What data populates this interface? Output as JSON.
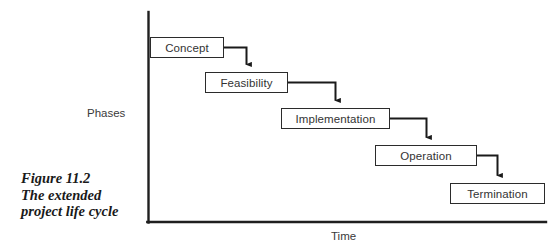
{
  "figure": {
    "caption_lines": [
      "Figure 11.2",
      "The extended",
      "project life cycle"
    ],
    "caption_full": "Figure 11.2 The extended project life cycle"
  },
  "axes": {
    "y_label": "Phases",
    "x_label": "Time",
    "origin": {
      "x": 148,
      "y": 222
    },
    "y_top": 12,
    "x_right": 546,
    "line_color": "#1f1f1f"
  },
  "diagram": {
    "type": "staircase-flow",
    "box_fill": "#ffffff",
    "box_border": "#2b2b2b",
    "connector_color": "#1a1a1a",
    "phases": [
      {
        "label": "Concept",
        "x": 150,
        "y": 37,
        "width": 74,
        "height": 21
      },
      {
        "label": "Feasibility",
        "x": 205,
        "y": 72,
        "width": 83,
        "height": 21
      },
      {
        "label": "Implementation",
        "x": 281,
        "y": 108,
        "width": 109,
        "height": 21
      },
      {
        "label": "Operation",
        "x": 375,
        "y": 145,
        "width": 102,
        "height": 21
      },
      {
        "label": "Termination",
        "x": 450,
        "y": 183,
        "width": 95,
        "height": 21
      }
    ],
    "connectors": [
      {
        "from": "Concept",
        "to": "Feasibility"
      },
      {
        "from": "Feasibility",
        "to": "Implementation"
      },
      {
        "from": "Implementation",
        "to": "Operation"
      },
      {
        "from": "Operation",
        "to": "Termination"
      }
    ]
  }
}
